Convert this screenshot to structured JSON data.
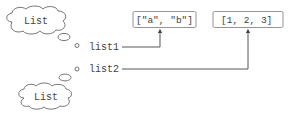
{
  "diagram": {
    "clouds": [
      {
        "label": "List"
      },
      {
        "label": "List"
      }
    ],
    "variables": [
      {
        "name": "list1"
      },
      {
        "name": "list2"
      }
    ],
    "objects": [
      {
        "value": "[\"a\", \"b\"]"
      },
      {
        "value": "[1, 2, 3]"
      }
    ],
    "colors": {
      "stroke": "#555555",
      "box_stroke": "#888888",
      "text": "#444444"
    }
  }
}
